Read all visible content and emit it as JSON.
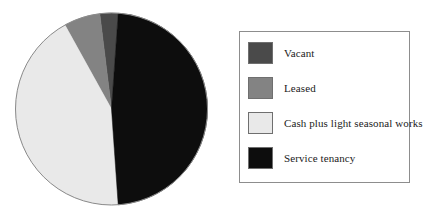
{
  "chart_data": {
    "type": "pie",
    "title": "",
    "subtitle": "",
    "xlabel": "",
    "ylabel": "",
    "grid": false,
    "legend_position": "right",
    "start_angle_deg": -7,
    "direction": "clockwise",
    "categories": [
      "Vacant",
      "Leased",
      "Cash plus light seasonal works",
      "Service tenancy"
    ],
    "values": [
      3,
      6,
      43,
      48
    ],
    "unit": "percent",
    "slices": [
      {
        "label": "Vacant",
        "value": 3,
        "color": "#4a4a4a",
        "start_deg": 353,
        "end_deg": 364
      },
      {
        "label": "Leased",
        "value": 6,
        "color": "#838383",
        "start_deg": 331,
        "end_deg": 353
      },
      {
        "label": "Cash plus light seasonal works",
        "value": 43,
        "color": "#e9e9e9",
        "start_deg": 176,
        "end_deg": 331
      },
      {
        "label": "Service tenancy",
        "value": 48,
        "color": "#0d0d0d",
        "start_deg": 364,
        "end_deg": 536
      }
    ]
  },
  "legend": {
    "border_color": "#8d8d8d",
    "items": [
      {
        "label": "Vacant",
        "color": "#4a4a4a"
      },
      {
        "label": "Leased",
        "color": "#838383"
      },
      {
        "label": "Cash plus light seasonal works",
        "color": "#e9e9e9"
      },
      {
        "label": "Service tenancy",
        "color": "#0d0d0d"
      }
    ]
  },
  "pie": {
    "center_x": 101.5,
    "center_y": 101,
    "radius": 96,
    "outline_color": "#8a8a8a"
  }
}
